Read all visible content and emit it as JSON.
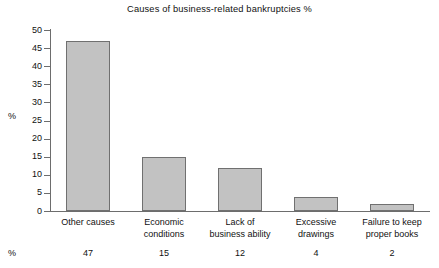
{
  "chart_data": {
    "type": "bar",
    "title": "Causes of business-related bankruptcies %",
    "xlabel": "",
    "ylabel": "%",
    "ylim": [
      0,
      50
    ],
    "ytick_step": 5,
    "yticks": [
      "50",
      "45",
      "40",
      "35",
      "30",
      "25",
      "20",
      "15",
      "10",
      "5",
      "0"
    ],
    "grid": false,
    "legend": "none",
    "bar_fill_color": "#c2c2c2",
    "bar_border_color": "#707070",
    "axis_color": "#6d6d6d",
    "background_color": "#ffffff",
    "categories": [
      "Other causes",
      "Economic conditions",
      "Lack of business ability",
      "Excessive drawings",
      "Failure to keep proper books"
    ],
    "category_lines": [
      [
        "Other causes"
      ],
      [
        "Economic",
        "conditions"
      ],
      [
        "Lack of",
        "business ability"
      ],
      [
        "Excessive",
        "drawings"
      ],
      [
        "Failure to keep",
        "proper books"
      ]
    ],
    "values": [
      47,
      15,
      12,
      4,
      2
    ],
    "value_labels": [
      "47",
      "15",
      "12",
      "4",
      "2"
    ],
    "value_row_label": "%"
  }
}
